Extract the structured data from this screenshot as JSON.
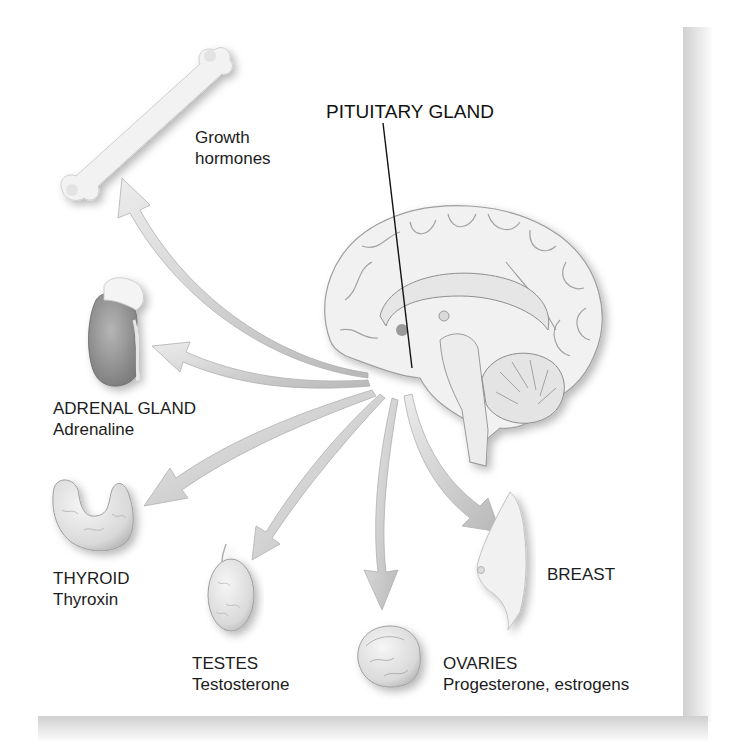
{
  "diagram": {
    "type": "endocrine-hormone-targets",
    "center": {
      "label": "PITUITARY GLAND",
      "icon": "brain-sagittal-icon"
    },
    "targets": [
      {
        "id": "bone",
        "icon": "femur-bone-icon",
        "title": "",
        "hormone": "Growth\nhormones",
        "line1": "Growth",
        "line2": "hormones"
      },
      {
        "id": "adrenal",
        "icon": "kidney-adrenal-icon",
        "title": "ADRENAL GLAND",
        "hormone": "Adrenaline"
      },
      {
        "id": "thyroid",
        "icon": "thyroid-icon",
        "title": "THYROID",
        "hormone": "Thyroxin"
      },
      {
        "id": "testes",
        "icon": "testis-icon",
        "title": "TESTES",
        "hormone": "Testosterone"
      },
      {
        "id": "ovaries",
        "icon": "ovary-icon",
        "title": "OVARIES",
        "hormone": "Progesterone, estrogens"
      },
      {
        "id": "breast",
        "icon": "breast-icon",
        "title": "BREAST",
        "hormone": ""
      }
    ],
    "colors": {
      "arrow_fill": "#dcdcdc",
      "arrow_edge": "#a8a8a8",
      "organ_fill": "#efefef",
      "organ_shade": "#9a9a9a",
      "text": "#1c1c1c",
      "leader_line": "#111111"
    }
  }
}
